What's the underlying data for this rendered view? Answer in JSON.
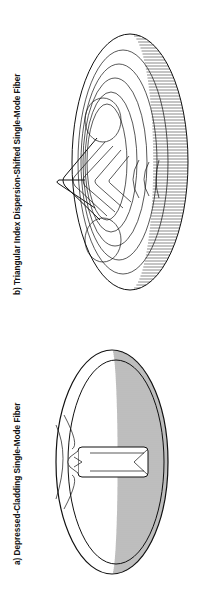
{
  "figures": [
    {
      "id": "a",
      "caption": "a)  Depressed-Cladding Single-Mode Fiber",
      "description": "3D wireframe surface plot of refractive index profile, flat-top central pillar inside a depressed elliptical well"
    },
    {
      "id": "b",
      "caption": "b)  Triangular Index Dispersion-Shifted Single-Mode Fiber",
      "description": "3D wireframe surface plot of refractive index profile with a triangular central peak surrounded by a ring"
    }
  ],
  "orientation": "rotated -90 degrees (landscape page shown in portrait)",
  "colors": {
    "background": "#ffffff",
    "ink": "#111111"
  }
}
